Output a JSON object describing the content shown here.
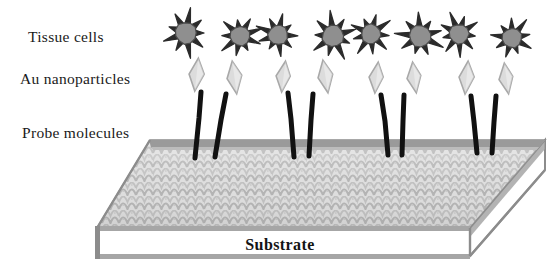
{
  "figure": {
    "name": "nanoparticle-biosensor-schematic",
    "width": 560,
    "height": 280,
    "background": "#ffffff"
  },
  "labels": {
    "tissue_cells": "Tissue cells",
    "au_nanoparticles": "Au nanoparticles",
    "probe_molecules": "Probe molecules",
    "substrate": "Substrate"
  },
  "label_positions": {
    "tissue_cells": {
      "x": 28,
      "y": 42
    },
    "au_nanoparticles": {
      "x": 20,
      "y": 84
    },
    "probe_molecules": {
      "x": 22,
      "y": 138
    },
    "substrate": {
      "x": 280,
      "y": 250
    }
  },
  "colors": {
    "outline": "#1a1a1a",
    "cell_body": "#8f8f8f",
    "cell_spikes": "#2b2b2b",
    "nanoparticle_fill": "#dcdcdc",
    "nanoparticle_edge": "#a8a8a8",
    "probe_stalk": "#111111",
    "slab_top_texture_light": "#dddddd",
    "slab_top_texture_dark": "#b4b4b4",
    "slab_back_edge": "#9a9a9a",
    "slab_front_face": "#ffffff",
    "slab_edge_gray": "#8c8c8c",
    "slab_rim": "#a6a6a6"
  },
  "cells": [
    {
      "id": "cell-1",
      "cx": 186,
      "cy": 33,
      "r": 11,
      "spikes": 9
    },
    {
      "id": "cell-2",
      "cx": 240,
      "cy": 36,
      "r": 10,
      "spikes": 9
    },
    {
      "id": "cell-3",
      "cx": 278,
      "cy": 35,
      "r": 10,
      "spikes": 9
    },
    {
      "id": "cell-4",
      "cx": 333,
      "cy": 36,
      "r": 11,
      "spikes": 9
    },
    {
      "id": "cell-5",
      "cx": 371,
      "cy": 34,
      "r": 10,
      "spikes": 9
    },
    {
      "id": "cell-6",
      "cx": 420,
      "cy": 36,
      "r": 11,
      "spikes": 9
    },
    {
      "id": "cell-7",
      "cx": 459,
      "cy": 34,
      "r": 10,
      "spikes": 9
    },
    {
      "id": "cell-8",
      "cx": 512,
      "cy": 38,
      "r": 10,
      "spikes": 9
    }
  ],
  "nanoparticles": [
    {
      "id": "np-1",
      "cx": 196,
      "cy": 75,
      "w": 15,
      "h": 32,
      "rot": 8
    },
    {
      "id": "np-2",
      "cx": 234,
      "cy": 78,
      "w": 15,
      "h": 32,
      "rot": -6
    },
    {
      "id": "np-3",
      "cx": 283,
      "cy": 77,
      "w": 14,
      "h": 31,
      "rot": 9
    },
    {
      "id": "np-4",
      "cx": 325,
      "cy": 77,
      "w": 15,
      "h": 32,
      "rot": -7
    },
    {
      "id": "np-5",
      "cx": 376,
      "cy": 78,
      "w": 14,
      "h": 31,
      "rot": 8
    },
    {
      "id": "np-6",
      "cx": 414,
      "cy": 78,
      "w": 14,
      "h": 31,
      "rot": -5
    },
    {
      "id": "np-7",
      "cx": 466,
      "cy": 78,
      "w": 15,
      "h": 32,
      "rot": 7
    },
    {
      "id": "np-8",
      "cx": 506,
      "cy": 79,
      "w": 14,
      "h": 31,
      "rot": -6
    }
  ],
  "probes": [
    {
      "id": "probe-1",
      "x_top": 201,
      "y_top": 92,
      "x_bot": 195,
      "y_bot": 158
    },
    {
      "id": "probe-2",
      "x_top": 226,
      "y_top": 94,
      "x_bot": 215,
      "y_bot": 157
    },
    {
      "id": "probe-3",
      "x_top": 288,
      "y_top": 93,
      "x_bot": 294,
      "y_bot": 157
    },
    {
      "id": "probe-4",
      "x_top": 313,
      "y_top": 94,
      "x_bot": 309,
      "y_bot": 156
    },
    {
      "id": "probe-5",
      "x_top": 381,
      "y_top": 95,
      "x_bot": 388,
      "y_bot": 155
    },
    {
      "id": "probe-6",
      "x_top": 404,
      "y_top": 95,
      "x_bot": 402,
      "y_bot": 155
    },
    {
      "id": "probe-7",
      "x_top": 471,
      "y_top": 96,
      "x_bot": 477,
      "y_bot": 153
    },
    {
      "id": "probe-8",
      "x_top": 496,
      "y_top": 96,
      "x_bot": 492,
      "y_bot": 153
    }
  ],
  "slab": {
    "top_face": "150,140 545,140 470,228 97,228",
    "front_face": "97,228 470,228 470,256 97,256",
    "right_face": "470,228 545,140 545,170 470,256",
    "back_edge_band": "150,140 545,140 541,147 152,147"
  }
}
